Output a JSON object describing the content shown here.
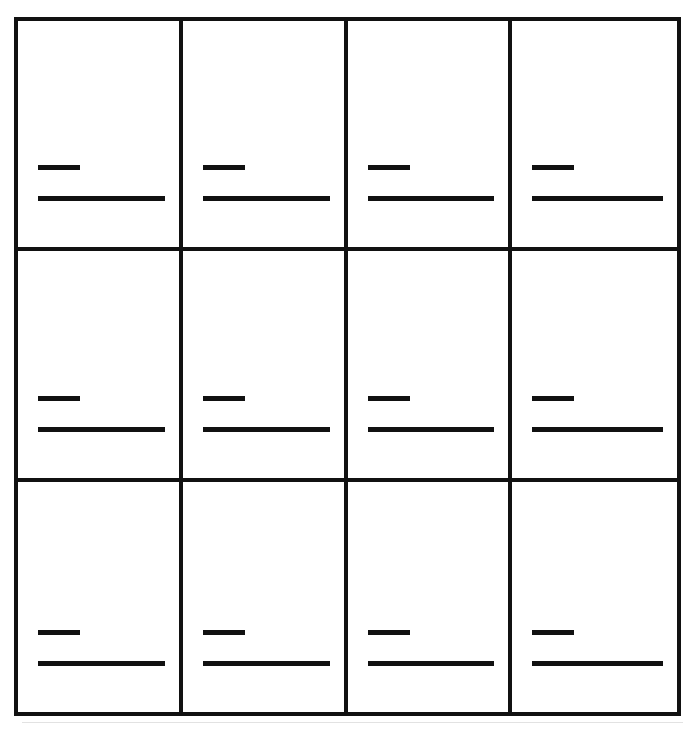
{
  "page": {
    "background_color": "#ffffff",
    "ink_color": "#111111",
    "width": 693,
    "height": 734
  },
  "grid": {
    "columns": 4,
    "rows": 3,
    "cell_count": 12,
    "border_width_px": 4,
    "frame": {
      "left": 14,
      "top": 17,
      "width": 667,
      "height": 699
    }
  },
  "marks": {
    "description": "Each cell contains two left-aligned horizontal black rules",
    "short_rule": {
      "label": "short-rule",
      "width_px": 42,
      "height_px": 5
    },
    "long_rule": {
      "label": "long-rule",
      "width_px": 133,
      "height_px": 5
    },
    "gap_px": 31
  },
  "cells": [
    {
      "id": "r1c1",
      "row": 1,
      "column": 1,
      "short_rule": "",
      "long_rule": ""
    },
    {
      "id": "r1c2",
      "row": 1,
      "column": 2,
      "short_rule": "",
      "long_rule": ""
    },
    {
      "id": "r1c3",
      "row": 1,
      "column": 3,
      "short_rule": "",
      "long_rule": ""
    },
    {
      "id": "r1c4",
      "row": 1,
      "column": 4,
      "short_rule": "",
      "long_rule": ""
    },
    {
      "id": "r2c1",
      "row": 2,
      "column": 1,
      "short_rule": "",
      "long_rule": ""
    },
    {
      "id": "r2c2",
      "row": 2,
      "column": 2,
      "short_rule": "",
      "long_rule": ""
    },
    {
      "id": "r2c3",
      "row": 2,
      "column": 3,
      "short_rule": "",
      "long_rule": ""
    },
    {
      "id": "r2c4",
      "row": 2,
      "column": 4,
      "short_rule": "",
      "long_rule": ""
    },
    {
      "id": "r3c1",
      "row": 3,
      "column": 1,
      "short_rule": "",
      "long_rule": ""
    },
    {
      "id": "r3c2",
      "row": 3,
      "column": 2,
      "short_rule": "",
      "long_rule": ""
    },
    {
      "id": "r3c3",
      "row": 3,
      "column": 3,
      "short_rule": "",
      "long_rule": ""
    },
    {
      "id": "r3c4",
      "row": 3,
      "column": 4,
      "short_rule": "",
      "long_rule": ""
    }
  ]
}
